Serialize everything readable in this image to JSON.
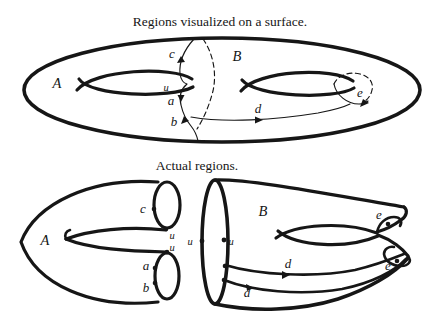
{
  "colors": {
    "ink": "#161616",
    "paper": "#ffffff"
  },
  "top_figure": {
    "title": "Regions visualized on a surface.",
    "labels": {
      "region_a": "A",
      "region_b": "B",
      "curve_c": "c",
      "point_u": "u",
      "curve_a": "a",
      "curve_b": "b",
      "curve_d": "d",
      "curve_e": "e"
    }
  },
  "bottom_figure": {
    "title": "Actual regions.",
    "piece_a": {
      "region_label": "A",
      "labels": {
        "curve_c": "c",
        "point_u_top": "u",
        "point_u_bottom": "u",
        "curve_a": "a",
        "curve_b": "b"
      }
    },
    "piece_b": {
      "region_label": "B",
      "labels": {
        "point_u_left": "u",
        "point_u_right": "u",
        "curve_e_top": "e",
        "curve_e_bottom": "e",
        "curve_d_upper": "d",
        "curve_d_lower": "d"
      }
    }
  }
}
